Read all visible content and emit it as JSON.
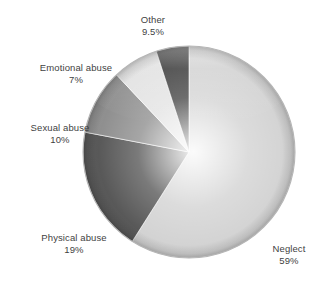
{
  "chart_data": {
    "type": "pie",
    "title": "",
    "subtitle": "",
    "xlabel": "",
    "ylabel": "",
    "legend_position": "none",
    "grid": false,
    "labels_inside": false,
    "start_angle_deg": 0,
    "direction": "clockwise",
    "categories": [
      "Neglect",
      "Physical abuse",
      "Sexual abuse",
      "Emotional abuse",
      "Other"
    ],
    "values": [
      59,
      19,
      10,
      7,
      9.5
    ],
    "value_unit": "%",
    "slices": [
      {
        "label": "Neglect",
        "value": 59,
        "value_text": "59%",
        "color": "#d2d2d2",
        "start_angle_deg": 0,
        "end_angle_deg": 212.4
      },
      {
        "label": "Physical abuse",
        "value": 19,
        "value_text": "19%",
        "color": "#555555",
        "start_angle_deg": 212.4,
        "end_angle_deg": 280.8
      },
      {
        "label": "Sexual abuse",
        "value": 10,
        "value_text": "10%",
        "color": "#8d8d8d",
        "start_angle_deg": 280.8,
        "end_angle_deg": 316.8
      },
      {
        "label": "Emotional abuse",
        "value": 7,
        "value_text": "7%",
        "color": "#e2e2e2",
        "start_angle_deg": 316.8,
        "end_angle_deg": 342.0
      },
      {
        "label": "Other",
        "value": 9.5,
        "value_text": "9.5%",
        "color": "#3a3a3a",
        "start_angle_deg": 342.0,
        "end_angle_deg": 360.0
      }
    ]
  },
  "labels": {
    "other": {
      "name": "Other",
      "value": "9.5%"
    },
    "emotional": {
      "name": "Emotional abuse",
      "value": "7%"
    },
    "sexual": {
      "name": "Sexual abuse",
      "value": "10%"
    },
    "physical": {
      "name": "Physical abuse",
      "value": "19%"
    },
    "neglect": {
      "name": "Neglect",
      "value": "59%"
    }
  },
  "style": {
    "background": "#ffffff",
    "text_color": "#3f3f3f",
    "rim_color": "#bdbdbd"
  }
}
